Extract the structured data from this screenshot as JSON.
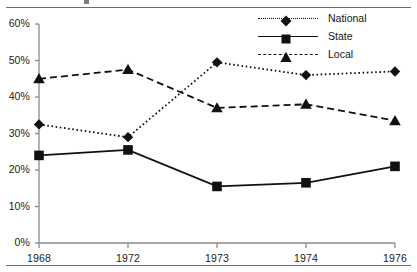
{
  "chart_data": {
    "type": "line",
    "title": "",
    "xlabel": "",
    "ylabel": "",
    "categories": [
      "1968",
      "1972",
      "1973",
      "1974",
      "1976"
    ],
    "ylim": [
      0,
      60
    ],
    "yticks": [
      "0%",
      "10%",
      "20%",
      "30%",
      "40%",
      "50%",
      "60%"
    ],
    "ytick_values": [
      0,
      10,
      20,
      30,
      40,
      50,
      60
    ],
    "grid": false,
    "legend_position": "top-right",
    "series": [
      {
        "name": "National",
        "marker": "diamond",
        "line_style": "dotted",
        "color": "#111111",
        "values": [
          32.5,
          29.0,
          49.5,
          46.0,
          47.0
        ]
      },
      {
        "name": "State",
        "marker": "square",
        "line_style": "solid",
        "color": "#111111",
        "values": [
          24.0,
          25.5,
          15.5,
          16.5,
          21.0
        ]
      },
      {
        "name": "Local",
        "marker": "triangle",
        "line_style": "dashed",
        "color": "#111111",
        "values": [
          45.0,
          47.5,
          37.0,
          38.0,
          33.5
        ]
      }
    ]
  },
  "axes": {
    "axis_color": "#8a8a8a"
  },
  "legend": {
    "entries": [
      {
        "label": "National",
        "marker": "diamond-icon",
        "style": "dotted"
      },
      {
        "label": "State",
        "marker": "square-icon",
        "style": "solid"
      },
      {
        "label": "Local",
        "marker": "triangle-icon",
        "style": "dashed"
      }
    ]
  }
}
